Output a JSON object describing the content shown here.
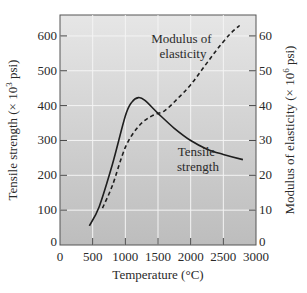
{
  "chart_data": {
    "type": "line",
    "title": "",
    "xlabel": "Temperature (°C)",
    "ylabel": "Tensile strength (× 10^3 psi)",
    "ylabel_parts": {
      "pre": "Tensile strength (× 10",
      "sup": "3",
      "post": " psi)"
    },
    "y2label": "Modulus of elasticity (× 10^6 psi)",
    "y2label_parts": {
      "pre": "Modulus of elasticity (× 10",
      "sup": "6",
      "post": " psi)"
    },
    "xlim": [
      0,
      3000
    ],
    "ylim": [
      0,
      660
    ],
    "y2lim": [
      0,
      66
    ],
    "x_ticks": [
      "0",
      "500",
      "1000",
      "1500",
      "2000",
      "2500",
      "3000"
    ],
    "y_ticks": [
      "0",
      "100",
      "200",
      "300",
      "400",
      "500",
      "600"
    ],
    "y2_ticks": [
      "0",
      "10",
      "20",
      "30",
      "40",
      "50",
      "60"
    ],
    "grid": true,
    "legend": null,
    "annotations": [
      {
        "text_lines": [
          "Modulus of",
          "elasticity"
        ],
        "series": "Modulus of elasticity"
      },
      {
        "text_lines": [
          "Tensile",
          "strength"
        ],
        "series": "Tensile strength"
      }
    ],
    "series": [
      {
        "name": "Tensile strength",
        "axis": "left",
        "style": "solid",
        "x": [
          450,
          600,
          800,
          1000,
          1100,
          1200,
          1300,
          1500,
          1750,
          2000,
          2250,
          2500,
          2800
        ],
        "values": [
          55,
          110,
          230,
          370,
          410,
          423,
          415,
          378,
          335,
          300,
          275,
          260,
          245
        ]
      },
      {
        "name": "Modulus of elasticity",
        "axis": "right",
        "style": "dashed",
        "x": [
          650,
          800,
          1000,
          1200,
          1400,
          1600,
          1800,
          2000,
          2200,
          2400,
          2600,
          2750
        ],
        "values": [
          10.6,
          17,
          28,
          34,
          37,
          38.5,
          42,
          46,
          51,
          56,
          60.5,
          63
        ]
      }
    ]
  },
  "colors": {
    "plot_bg_top": "#e6e6e6",
    "plot_bg_bottom": "#bdbdbd",
    "grid": "#f4f4f4",
    "line": "#1e1e1e",
    "axis": "#444444"
  }
}
